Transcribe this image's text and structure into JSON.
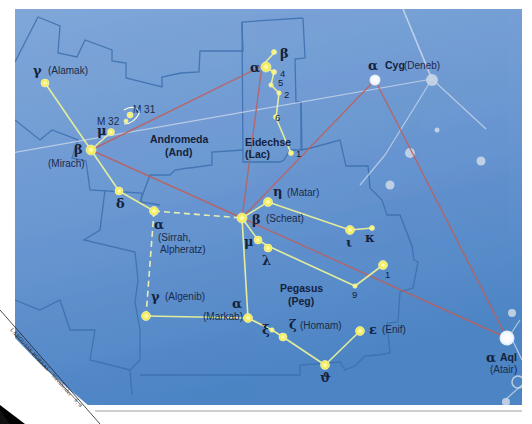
{
  "colors": {
    "sky_top": "#7ea4d6",
    "sky_bottom": "#4f86c6",
    "boundary": "#3f6fae",
    "asterism": "#e8f0a0",
    "star": "#f7f36a",
    "triangle_line": "#c0605a",
    "faint_star": "#c9d6e6",
    "faint_line": "#c7d5e8"
  },
  "constellations": [
    {
      "id": "andromeda",
      "name": "Andromeda",
      "abbr": "(And)"
    },
    {
      "id": "lacerta",
      "name": "Eidechse",
      "abbr": "(Lac)"
    },
    {
      "id": "pegasus",
      "name": "Pegasus",
      "abbr": "(Peg)"
    }
  ],
  "stars": {
    "and_gamma": {
      "greek": "γ",
      "name": "(Alamak)"
    },
    "and_beta": {
      "greek": "β",
      "name": "(Mirach)"
    },
    "and_mu": {
      "greek": "μ"
    },
    "and_delta": {
      "greek": "δ"
    },
    "and_alpha": {
      "greek": "α",
      "name_line1": "(Sirrah,",
      "name_line2": "Alpheratz)"
    },
    "m31": {
      "label": "M 31"
    },
    "m32": {
      "label": "M 32"
    },
    "lac_alpha": {
      "greek": "α"
    },
    "lac_beta": {
      "greek": "β"
    },
    "lac_4": {
      "label": "4"
    },
    "lac_5": {
      "label": "5"
    },
    "lac_2": {
      "label": "2"
    },
    "lac_6": {
      "label": "6"
    },
    "lac_1": {
      "label": "1"
    },
    "peg_beta": {
      "greek": "β",
      "name": "(Scheat)"
    },
    "peg_eta": {
      "greek": "η",
      "name": "(Matar)"
    },
    "peg_iota": {
      "greek": "ι"
    },
    "peg_kappa": {
      "greek": "κ"
    },
    "peg_mu": {
      "greek": "μ"
    },
    "peg_lambda": {
      "greek": "λ"
    },
    "peg_1": {
      "label": "1"
    },
    "peg_9": {
      "label": "9"
    },
    "peg_gamma": {
      "greek": "γ",
      "name": "(Algenib)"
    },
    "peg_alpha": {
      "greek": "α",
      "name": "(Markab)"
    },
    "peg_xi": {
      "greek": "ξ"
    },
    "peg_zeta": {
      "greek": "ζ",
      "name": "(Homam)"
    },
    "peg_epsilon": {
      "greek": "ε",
      "name": "(Enif)"
    },
    "peg_theta": {
      "greek": "ϑ"
    },
    "cyg_alpha": {
      "greek": "α",
      "con": "Cyg",
      "name": "(Deneb)"
    },
    "aql_alpha": {
      "greek": "α",
      "con": "Aql",
      "name": "(Atair)"
    }
  },
  "page_fold": {
    "text": "LAROUSSE BOREAL · Sternbilder · S. 8"
  }
}
